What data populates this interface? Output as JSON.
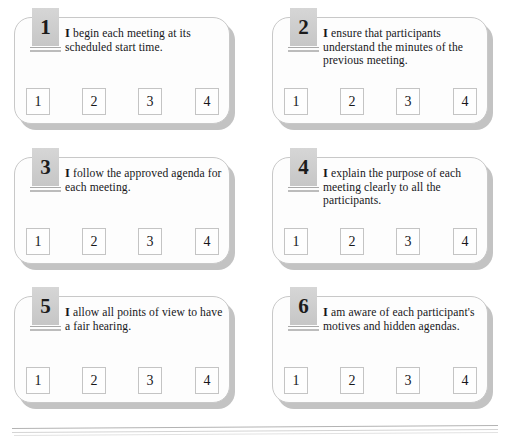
{
  "page": {
    "card_count": 6,
    "colors": {
      "page_background": "#ffffff",
      "card_background": "#fdfdfd",
      "card_border": "#c8c8c8",
      "card_shadow": "#b9b9b9",
      "badge_background": "#cdcdcd",
      "text": "#17171a",
      "scale_box_border": "#c4c4c4",
      "rule_line": "#b3b3b3"
    }
  },
  "scale": {
    "options": [
      "1",
      "2",
      "3",
      "4"
    ]
  },
  "cards": [
    {
      "number": "1",
      "lead": "I",
      "statement": " begin each meeting at its scheduled start time.",
      "full_text": "I begin each meeting at its scheduled start time.",
      "scale": [
        "1",
        "2",
        "3",
        "4"
      ]
    },
    {
      "number": "2",
      "lead": "I",
      "statement": " ensure that participants understand the minutes of the previous meeting.",
      "full_text": "I ensure that participants understand the minutes of the previous meeting.",
      "scale": [
        "1",
        "2",
        "3",
        "4"
      ]
    },
    {
      "number": "3",
      "lead": "I",
      "statement": " follow the approved agenda for each meeting.",
      "full_text": "I follow the approved agenda for each meeting.",
      "scale": [
        "1",
        "2",
        "3",
        "4"
      ]
    },
    {
      "number": "4",
      "lead": "I",
      "statement": " explain the purpose of each meeting clearly to all the participants.",
      "full_text": "I explain the purpose of each meeting clearly to all the participants.",
      "scale": [
        "1",
        "2",
        "3",
        "4"
      ]
    },
    {
      "number": "5",
      "lead": "I",
      "statement": " allow all points of view to have a fair hearing.",
      "full_text": "I allow all points of view to have a fair hearing.",
      "scale": [
        "1",
        "2",
        "3",
        "4"
      ]
    },
    {
      "number": "6",
      "lead": "I",
      "statement": " am aware of each participant's motives and hidden agendas.",
      "full_text": "I am aware of each participant's motives and hidden agendas.",
      "scale": [
        "1",
        "2",
        "3",
        "4"
      ]
    }
  ]
}
